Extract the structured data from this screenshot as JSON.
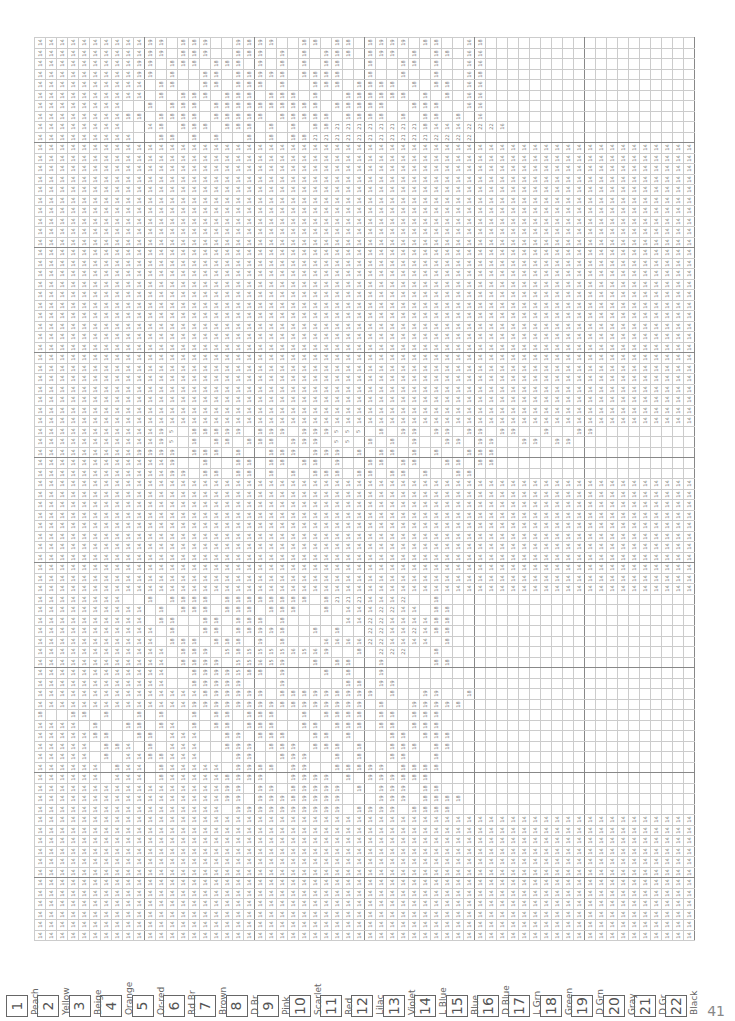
{
  "page": {
    "number": "41"
  },
  "legend": [
    {
      "num": "1",
      "label": "Peach"
    },
    {
      "num": "2",
      "label": "Yellow"
    },
    {
      "num": "3",
      "label": "Beige"
    },
    {
      "num": "4",
      "label": "Orange"
    },
    {
      "num": "5",
      "label": "Or-red"
    },
    {
      "num": "6",
      "label": "Rd Br"
    },
    {
      "num": "7",
      "label": "Brown"
    },
    {
      "num": "8",
      "label": "D Br"
    },
    {
      "num": "9",
      "label": "Pink"
    },
    {
      "num": "10",
      "label": "Scarlet"
    },
    {
      "num": "11",
      "label": "Red"
    },
    {
      "num": "12",
      "label": "Lilac"
    },
    {
      "num": "13",
      "label": "Violet"
    },
    {
      "num": "14",
      "label": "L Blue"
    },
    {
      "num": "15",
      "label": "Blue"
    },
    {
      "num": "16",
      "label": "D Blue"
    },
    {
      "num": "17",
      "label": "L Grn"
    },
    {
      "num": "18",
      "label": "Green"
    },
    {
      "num": "19",
      "label": "D Grn"
    },
    {
      "num": "20",
      "label": "Gray"
    },
    {
      "num": "21",
      "label": "D Gr"
    },
    {
      "num": "22",
      "label": "Black"
    }
  ],
  "grid": {
    "cols": 60,
    "rows": [
      "14 14 14 14 14 14 14 14 14 14 19 19 . 18 18 19 . . 19 18 19 19 . . 18 18 . 18 18 . 18 19 19 19 . 18 18 . . 16 18 . . . . . . . . . . . . . . . . . . .",
      "14 14 14 14 14 14 14 14 14 14 19 19 . 18 18 19 . . 18 18 19 . 19 . 18 . 19 18 18 . 18 19 19 . 18 . 18 18 . 16 16 . . . . . . . . . . . . . . . . . . .",
      "14 14 14 14 14 14 14 14 14 19 19 . 18 18 18 . 18 18 18 . 19 . 18 . 18 . 18 18 . . 18 . . 18 18 . 18 . . 16 16 . . . . . . . . . . . . . . . . . . .",
      "14 14 14 14 14 14 14 14 14 19 19 . 18 . . 18 18 . 18 18 19 19 18 . 18 18 18 18 . . 18 . . 18 . . 18 . . 16 18 . . . . . . . . . . . . . . . . . . .",
      "14 14 14 14 14 14 14 14 14 14 . 18 18 . . 18 18 . 18 18 18 . 18 . . 18 18 18 . 18 18 18 18 . 18 . 18 18 . 16 16 . . . . . . . . . . . . . . . . . . .",
      "14 14 14 14 14 14 14 14 14 14 . 18 . 18 18 18 . 18 18 18 . 18 18 18 . 18 . . 18 18 18 18 18 18 . 18 . 18 . 16 16 . . . . . . . . . . . . . . . . . . .",
      "14 14 14 14 14 14 14 14 . . 18 . 18 18 18 . 18 18 18 18 18 18 18 18 18 18 . 18 18 18 18 18 . . 18 18 18 . . 16 16 . . . . . . . . . . . . . . . . . . .",
      "14 14 14 14 14 14 14 14 18 18 . 18 18 18 18 . 18 18 18 18 18 . 18 18 18 18 18 . 18 18 18 18 . 18 . 18 18 . 18 . 16 . . . . . . . . . . . . . . . . . .",
      "14 14 14 14 14 14 14 14 . . 14 18 . 18 18 18 . 18 18 18 . 18 . 18 . 18 18 21 21 21 21 21 21 21 21 18 14 14 14 22 22 22 16 . . . . . . . . . . . . . . . . .",
      "14 14 14 14 14 14 14 14 14 . . 18 18 . 18 . 18 . . 18 . 18 . 18 18 21 21 21 21 21 21 21 21 21 21 21 22 22 22 22 . . . . . . . . . . . . . . . . . . .",
      "14 14 14 14 14 14 14 14 14 14 14 14 14 14 14 14 14 14 14 14 14 14 14 14 14 14 14 14 14 14 14 14 14 14 14 14 14 14 14 14 14 14 14 14 14 14 14 14 14 14 14 14 14 14 14 14 14 14 14 14",
      "14 14 14 14 14 14 14 14 14 14 14 14 14 14 14 14 14 14 14 14 14 14 14 14 14 14 14 14 14 14 14 14 14 14 14 14 14 14 14 14 14 14 14 14 14 14 14 14 14 14 14 14 14 14 14 14 14 14 14 14",
      "14 14 14 14 14 14 14 14 14 14 14 14 14 14 14 14 14 14 14 14 14 14 14 14 14 14 14 14 14 14 14 14 14 14 14 14 14 14 14 14 14 14 14 14 14 14 14 14 14 14 14 14 14 14 14 14 14 14 14 14",
      "14 14 14 14 14 14 14 14 14 14 14 14 14 14 14 14 14 14 14 14 14 14 14 14 14 14 14 14 14 14 14 14 14 14 14 14 14 14 14 14 14 14 14 14 14 14 14 14 14 14 14 14 14 14 14 14 14 14 14 14",
      "14 14 14 14 14 14 14 14 14 14 14 14 14 14 14 14 14 14 14 14 14 14 14 14 14 14 14 14 14 14 14 14 14 14 14 14 14 14 14 14 14 14 14 14 14 14 14 14 14 14 14 14 14 14 14 14 14 14 14 14",
      "14 14 14 14 14 14 14 14 14 14 14 14 14 14 14 14 14 14 14 14 14 14 14 14 14 14 14 14 14 14 14 14 14 14 14 14 14 14 14 14 14 14 14 14 14 14 14 14 14 14 14 14 14 14 14 14 14 14 14 14",
      "14 14 14 14 14 14 14 14 14 14 14 14 14 14 14 14 14 14 14 14 14 14 14 14 14 14 14 14 14 14 14 14 14 14 14 14 14 14 14 14 14 14 14 14 14 14 14 14 14 14 14 14 14 14 14 14 14 14 14 14",
      "14 14 14 14 14 14 14 14 14 14 14 14 14 14 14 14 14 14 14 14 14 14 14 14 14 14 14 14 14 14 14 14 14 14 14 14 14 14 14 14 14 14 14 14 14 14 14 14 14 14 14 14 14 14 14 14 14 14 14 14",
      "14 14 14 14 14 14 14 14 14 14 14 14 14 14 14 14 14 14 14 14 14 14 14 14 14 14 14 14 14 14 14 14 14 14 14 14 14 14 14 14 14 14 14 14 14 14 14 14 14 14 14 14 14 14 14 14 14 14 14 14",
      "14 14 14 14 14 14 14 14 14 14 14 14 14 14 14 14 14 14 14 14 14 14 14 14 14 14 14 14 14 14 14 14 14 14 14 14 14 14 14 14 14 14 14 14 14 14 14 14 14 14 14 14 14 14 14 14 14 14 14 14",
      "14 14 14 14 14 14 14 14 14 14 14 14 14 14 14 14 14 14 14 14 14 14 14 14 14 14 14 14 14 14 14 14 14 14 14 14 14 14 14 14 14 14 14 14 14 14 14 14 14 14 14 14 14 14 14 14 14 14 14 14",
      "14 14 14 14 14 14 14 14 14 14 14 14 14 14 14 14 14 14 14 14 14 14 14 14 14 14 14 14 14 14 14 14 14 14 14 14 14 14 14 14 14 14 14 14 14 14 14 14 14 14 14 14 14 14 14 14 14 14 14 14",
      "14 14 14 14 14 14 14 14 14 14 14 14 14 14 14 14 14 14 14 14 14 14 14 14 14 14 14 14 14 14 14 14 14 14 14 14 14 14 14 14 14 14 14 14 14 14 14 14 14 14 14 14 14 14 14 14 14 14 14 14",
      "14 14 14 14 14 14 14 14 14 14 14 14 14 14 14 14 14 14 14 14 14 14 14 14 14 14 14 14 14 14 14 14 14 14 14 14 14 14 14 14 14 14 14 14 14 14 14 14 14 14 14 14 14 14 14 14 14 14 14 14",
      "14 14 14 14 14 14 14 14 14 14 14 14 14 14 14 14 14 14 14 14 14 14 14 14 14 14 14 14 14 14 14 14 14 14 14 14 14 14 14 14 14 14 14 14 14 14 14 14 14 14 14 14 14 14 14 14 14 14 14 14",
      "14 14 14 14 14 14 14 14 14 14 14 14 14 14 14 14 14 14 14 14 14 14 14 14 14 14 14 14 14 14 14 14 14 14 14 14 14 14 14 14 14 14 14 14 14 14 14 14 14 14 14 14 14 14 14 14 14 14 14 14",
      "14 14 14 14 14 14 14 14 14 14 14 14 14 14 14 14 14 14 14 14 14 14 14 14 14 14 14 14 14 14 14 14 14 14 14 14 14 14 14 14 14 14 14 14 14 14 14 14 14 14 14 14 14 14 14 14 14 14 14 14",
      "14 14 14 14 14 14 14 14 14 14 14 14 14 14 14 14 14 14 14 14 14 14 14 14 14 14 14 14 14 14 14 14 14 14 14 14 14 14 14 14 14 14 14 14 14 14 14 14 14 14 14 14 14 14 14 14 14 14 14 14",
      "14 14 14 14 14 14 14 14 14 14 14 14 14 14 14 14 14 14 14 14 14 14 14 14 14 14 14 14 14 14 14 14 14 14 14 14 14 14 14 14 14 14 14 14 14 14 14 14 14 14 14 14 14 14 14 14 14 14 14 14",
      "14 14 14 14 14 14 14 14 14 14 14 14 14 14 14 14 14 14 14 14 14 14 14 14 14 14 14 14 14 14 14 14 14 14 14 14 14 14 14 14 14 14 14 14 14 14 14 14 14 14 14 14 14 14 14 14 14 14 14 14",
      "14 14 14 14 14 14 14 14 14 14 14 14 14 14 14 14 14 14 14 14 14 14 14 14 14 14 14 14 14 14 14 14 14 14 14 14 14 14 14 14 14 14 14 14 14 14 14 14 14 14 14 14 14 14 14 14 14 14 14 14",
      "14 14 14 14 14 14 14 14 14 14 14 14 14 14 14 14 14 14 14 14 14 14 14 14 14 14 14 14 14 14 14 14 14 14 14 14 14 14 14 14 14 14 14 14 14 14 14 14 14 14 14 14 14 14 14 14 14 14 14 14",
      "14 14 14 14 14 14 14 14 14 14 14 14 14 14 14 14 14 14 14 14 14 14 14 14 14 14 14 14 14 14 14 14 14 14 14 14 14 14 14 14 14 14 14 14 14 14 14 14 14 14 14 14 14 14 14 14 14 14 14 14",
      "14 14 14 14 14 14 14 14 14 14 14 14 14 14 14 14 14 14 14 14 14 14 14 14 14 14 14 14 14 14 14 14 14 14 14 14 14 14 14 14 14 14 14 14 14 14 14 14 14 14 14 14 14 14 14 14 14 14 14 14",
      "14 14 14 14 14 14 14 14 14 14 14 14 14 14 14 14 14 14 14 14 14 14 14 14 14 14 14 14 14 14 14 14 14 14 14 14 14 14 14 14 14 14 14 14 14 14 14 14 14 14 14 14 14 14 14 14 14 14 14 14",
      "14 14 14 14 14 14 14 14 14 14 14 14 14 14 14 14 14 14 14 14 14 14 14 14 14 14 14 14 14 14 14 14 14 14 14 14 14 14 14 14 14 14 14 14 14 14 14 14 14 14 14 14 14 14 14 14 14 14 14 14",
      "14 14 14 14 14 14 14 14 14 14 14 14 14 14 14 14 14 14 14 14 14 14 14 14 14 14 14 14 14 14 14 14 14 14 14 14 14 14 14 14 14 14 14 14 14 14 14 14 14 14 14 14 14 14 14 14 14 14 14 14",
      "14 14 14 14 14 14 14 14 14 14 14 19 5 . 18 18 18 19 19 . 18 19 19 . 19 19 19 5 5 5 . 18 . 19 19 . 19 19 . 19 19 . 19 19 . . 19 . . 19 19 . . . . . . . . .",
      "14 14 14 14 14 14 14 14 14 14 14 19 5 . 18 . 18 18 . 18 18 18 . 19 19 19 . 5 5 . 18 . 18 . 19 . . 19 19 . 19 19 . . 19 19 . 19 19 . . . . . . . . . . .",
      "14 14 14 14 14 14 14 14 14 19 19 19 19 . 18 18 18 . 18 . . 18 18 19 . 19 19 19 . 18 . 18 18 . 18 . 18 . . 18 18 18 . . . . . . . . . . . . . . . . . .",
      "14 14 14 14 14 14 14 14 14 14 14 14 19 . . 18 . . 18 18 . 18 18 . 18 18 . 19 . . 18 18 . 18 18 . . 18 18 . 18 18 . . . . . . . . . . . . . . . . . .",
      "14 14 14 14 14 14 14 14 14 14 14 14 19 19 . 18 18 . 18 18 . 18 . 18 . 18 18 18 . 18 18 . 18 18 . 18 . . 18 18 . . . . . . . . . . . . . . . . . . . .",
      "14 14 14 14 14 14 14 14 14 14 14 14 14 14 14 14 14 14 14 14 14 14 14 14 14 14 14 14 14 14 14 14 14 14 14 14 14 14 14 14 14 14 14 14 14 14 14 14 14 14 14 14 14 14 14 14 14 14 14 14",
      "14 14 14 14 14 14 14 14 14 14 14 14 14 14 14 14 14 14 14 14 14 14 14 14 14 14 14 14 14 14 14 14 14 14 14 14 14 14 14 14 14 14 14 14 14 14 14 14 14 14 14 14 14 14 14 14 14 14 14 14",
      "14 14 14 14 14 14 14 14 14 14 14 14 14 14 14 14 14 14 14 14 14 14 14 14 14 14 14 14 14 14 14 14 14 14 14 14 14 14 14 14 14 14 14 14 14 14 14 14 14 14 14 14 14 14 14 14 14 14 14 14",
      "14 14 14 14 14 14 14 14 14 14 14 14 14 14 14 14 14 14 14 14 14 14 14 14 14 14 14 14 14 14 14 14 14 14 14 14 14 14 14 14 14 14 14 14 14 14 14 14 14 14 14 14 14 14 14 14 14 14 14 14",
      "14 14 14 14 14 14 14 14 14 14 14 14 14 14 14 14 14 14 14 14 14 14 14 14 14 14 14 14 14 14 14 14 14 14 14 14 14 14 14 14 14 14 14 14 14 14 14 14 14 14 14 14 14 14 14 14 14 14 14 14",
      "14 14 14 14 14 14 14 14 14 14 14 14 14 14 14 14 14 14 14 14 14 14 14 14 14 14 14 14 14 14 14 14 14 14 14 14 14 14 14 14 14 14 14 14 14 14 14 14 14 14 14 14 14 14 14 14 14 14 14 14",
      "14 14 14 14 14 14 14 14 14 14 14 14 14 14 14 14 14 14 14 14 14 14 14 14 14 14 14 14 14 14 14 14 14 14 14 14 14 14 14 14 14 14 14 14 14 14 14 14 14 14 14 14 14 14 14 14 14 14 14 14",
      "14 14 14 14 14 14 14 14 14 14 14 14 14 14 14 14 14 14 14 14 14 14 14 14 14 14 14 14 14 14 14 14 14 14 14 14 14 14 14 14 14 14 14 14 14 14 14 14 14 14 14 14 14 14 14 14 14 14 14 14",
      "14 14 14 14 14 14 14 14 14 14 14 14 14 14 14 14 14 14 14 14 14 14 14 14 14 14 14 14 14 14 14 14 14 14 14 14 14 14 14 14 14 14 14 14 14 14 14 14 14 14 14 14 14 14 14 14 14 14 14 14",
      "14 14 14 14 14 14 14 14 14 14 14 14 14 14 14 14 14 14 14 14 14 14 14 14 14 14 14 14 14 14 14 14 14 14 14 14 14 14 14 14 14 14 14 14 14 14 14 14 14 14 14 14 14 14 14 14 14 14 14 14",
      "14 14 14 14 14 14 14 14 14 14 14 14 14 14 14 14 14 14 14 14 14 14 14 14 14 14 14 14 14 14 14 14 14 14 14 14 14 14 14 14 14 14 14 14 14 14 14 14 14 14 14 14 14 14 14 14 14 14 14 14",
      "14 14 14 14 14 14 14 14 . . 18 . 18 18 18 18 . 18 18 18 18 18 18 18 18 . 18 21 21 21 14 14 14 22 . . 18 . . . . . . . . . . . . . . . . . . . . . . .",
      "14 14 14 14 14 14 14 14 14 14 . 18 . 18 18 18 . 18 18 18 . 18 18 18 . . 18 . 14 14 14 22 22 14 14 . 18 18 . . . . . . . . . . . . . . . . . . . . . .",
      "14 14 14 14 14 14 14 14 14 14 . 18 18 . . 18 18 . 18 18 18 . 18 . . . . . 14 14 22 22 14 14 14 14 18 18 . . . . . . . . . . . . . . . . . . . . . .",
      "14 14 14 14 14 14 14 14 14 14 14 . 18 . . 18 18 . 18 18 19 19 18 . . 18 . 18 . . 22 22 14 14 22 14 18 18 . . . . . . . . . . . . . . . . . . . . . .",
      "14 14 14 14 14 14 14 14 14 14 14 . 18 18 18 . 18 18 18 . 19 . 18 . . . 16 16 16 16 22 22 14 14 14 14 . 18 . . . . . . . . . . . . . . . . . . . . . .",
      "14 14 14 14 14 14 14 14 14 14 14 14 . 18 18 19 . 15 18 15 15 15 15 16 15 16 19 . . 18 . 22 22 22 . . 18 . . . . . . . . . . . . . . . . . . . . . . .",
      "14 14 14 14 14 14 14 14 14 14 14 14 . 18 18 19 19 . 15 15 16 15 19 . . 18 . 18 18 . . 19 . . . . 18 18 . . . . . . . . . . . . . . . . . . . . . . .",
      "14 14 14 14 14 14 14 14 14 14 14 14 . . 18 19 19 19 15 18 18 . 19 . . . 18 . 18 . . 19 . . . . . . . . . . . . . . . . . . . . . . . . . . . . .",
      "14 14 14 14 14 14 14 14 14 14 14 14 . . 18 19 19 19 19 . . . 19 . . . . . 18 18 . 19 19 . . . . . . . . . . . . . . . . . . . . . . . . . . . .",
      "14 14 14 14 14 14 14 14 14 14 14 14 14 14 14 18 19 19 19 19 19 . 18 18 18 19 19 18 19 19 19 . 18 . . 19 19 . . 18 . . . . . . . . . . . . . . . . . . . .",
      "14 14 14 14 14 14 14 14 14 14 14 14 14 14 19 19 19 19 19 19 19 19 18 18 19 19 19 19 19 19 . 18 . . 19 19 19 19 18 . . . . . . . . . . . . . . . . . . . .",
      "18 . . 18 18 . 18 . . 18 . 18 . . 18 . 18 18 . 18 18 18 . . 18 . 18 18 18 18 . 18 18 . 18 18 18 . . . . . . . . . . . . . . . . . . . . . . .",
      "14 14 14 14 . 18 . . 18 18 . 18 14 . 18 . 18 18 . 18 18 18 . . 18 18 . 18 18 18 . 18 18 . 18 18 18 . . . . . . . . . . . . . . . . . . . . . . .",
      "14 14 14 14 14 18 18 . . 18 18 . 14 14 14 . . 18 19 . 18 18 18 . . 18 18 . 18 . . . 18 18 . 18 18 18 . . . . . . . . . . . . . . . . . . . . . .",
      "14 14 14 14 14 . 18 18 14 . 18 . 14 14 14 . . 18 19 19 . 18 18 19 . 18 18 18 . 18 . . 18 18 18 . 18 18 . . . . . . . . . . . . . . . . . . . . . .",
      "14 14 14 14 14 . 18 . 14 14 18 18 14 14 14 . . . 19 19 . . 18 19 19 . . 18 . 18 . . 18 18 . . 18 . . . . . . . . . . . . . . . . . . . . . . .",
      "14 14 14 14 14 14 . 18 14 14 . 18 14 14 14 14 14 . 19 19 18 18 . 19 19 . . 18 18 18 19 19 . 18 18 18 18 . . . . . . . . . . . . . . . . . . . . . .",
      "14 14 14 14 14 14 . 14 14 14 . 18 14 14 14 14 14 18 19 19 19 . . 19 19 19 19 . 18 . 19 19 19 18 18 18 . . . . . . . . . . . . . . . . . . . . . . .",
      "14 14 14 14 14 14 14 14 14 14 14 14 14 14 14 14 14 19 19 . 19 19 . 18 19 19 19 19 . 18 . 19 19 19 . 18 18 . . . . . . . . . . . . . . . . . . . . . .",
      "14 14 14 14 14 14 14 14 14 14 14 14 14 14 14 14 14 19 19 . 19 19 19 18 19 19 19 19 . . . 19 19 19 . 18 18 18 18 . . . . . . . . . . . . . . . . . . . . .",
      "14 14 14 14 14 14 14 14 14 14 14 14 14 14 14 14 14 . 19 19 19 19 19 19 19 19 19 19 . 18 19 19 19 . 18 18 18 18 . . . . . . . . . . . . . . . . . . . . .",
      "14 14 14 14 14 14 14 14 14 14 14 14 14 14 14 14 14 14 14 14 14 14 14 14 14 14 14 14 14 14 14 14 14 14 14 14 14 14 14 14 14 14 14 14 14 14 14 14 14 14 14 14 14 14 14 14 14 14 14 14",
      "14 14 14 14 14 14 14 14 14 14 14 14 14 14 14 14 14 14 14 14 14 14 14 14 14 14 14 14 14 14 14 14 14 14 14 14 14 14 14 14 14 14 14 14 14 14 14 14 14 14 14 14 14 14 14 14 14 14 14 14",
      "14 14 14 14 14 14 14 14 14 14 14 14 14 14 14 14 14 14 14 14 14 14 14 14 14 14 14 14 14 14 14 14 14 14 14 14 14 14 14 14 14 14 14 14 14 14 14 14 14 14 14 14 14 14 14 14 14 14 14 14",
      "14 14 14 14 14 14 14 14 14 14 14 14 14 14 14 14 14 14 14 14 14 14 14 14 14 14 14 14 14 14 14 14 14 14 14 14 14 14 14 14 14 14 14 14 14 14 14 14 14 14 14 14 14 14 14 14 14 14 14 14",
      "14 14 14 14 14 14 14 14 14 14 14 14 14 14 14 14 14 14 14 14 14 14 14 14 14 14 14 14 14 14 14 14 14 14 14 14 14 14 14 14 14 14 14 14 14 14 14 14 14 14 14 14 14 14 14 14 14 14 14 14",
      "14 14 14 14 14 14 14 14 14 14 14 14 14 14 14 14 14 14 14 14 14 14 14 14 14 14 14 14 14 14 14 14 14 14 14 14 14 14 14 14 14 14 14 14 14 14 14 14 14 14 14 14 14 14 14 14 14 14 14 14",
      "14 14 14 14 14 14 14 14 14 14 14 14 14 14 14 14 14 14 14 14 14 14 14 14 14 14 14 14 14 14 14 14 14 14 14 14 14 14 14 14 14 14 14 14 14 14 14 14 14 14 14 14 14 14 14 14 14 14 14 14",
      "14 14 14 14 14 14 14 14 14 14 14 14 14 14 14 14 14 14 14 14 14 14 14 14 14 14 14 14 14 14 14 14 14 14 14 14 14 14 14 14 14 14 14 14 14 14 14 14 14 14 14 14 14 14 14 14 14 14 14 14",
      "14 14 14 14 14 14 14 14 14 14 14 14 14 14 14 14 14 14 14 14 14 14 14 14 14 14 14 14 14 14 14 14 14 14 14 14 14 14 14 14 14 14 14 14 14 14 14 14 14 14 14 14 14 14 14 14 14 14 14 14",
      "14 14 14 14 14 14 14 14 14 14 14 14 14 14 14 14 14 14 14 14 14 14 14 14 14 14 14 14 14 14 14 14 14 14 14 14 14 14 14 14 14 14 14 14 14 14 14 14 14 14 14 14 14 14 14 14 14 14 14 14",
      "14 14 14 14 14 14 14 14 14 14 14 14 14 14 14 14 14 14 14 14 14 14 14 14 14 14 14 14 14 14 14 14 14 14 14 14 14 14 14 14 14 14 14 14 14 14 14 14 14 14 14 14 14 14 14 14 14 14 14 14",
      "14 14 14 14 14 14 14 14 14 14 14 14 14 14 14 14 14 14 14 14 14 14 14 14 14 14 14 14 14 14 14 14 14 14 14 14 14 14 14 14 14 14 14 14 14 14 14 14 14 14 14 14 14 14 14 14 14 14 14 14"
    ]
  }
}
